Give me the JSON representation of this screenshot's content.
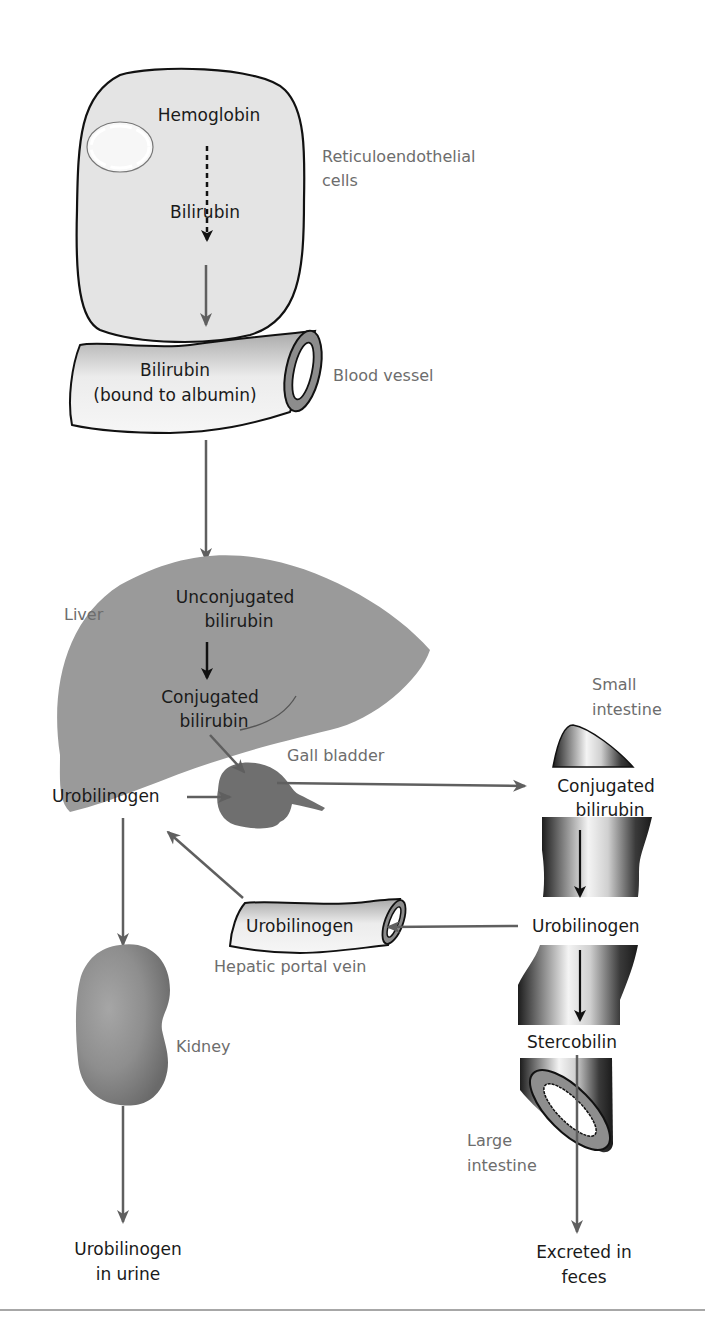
{
  "figure": {
    "colors": {
      "arrow": "#5f5f5f",
      "internal_arrow": "#111111",
      "organ_fill": "#9a9a9a",
      "gall_bladder_fill": "#6f6f6f",
      "cell_fill": "#e4e4e4",
      "label_gray": "#6d6d6d",
      "label_dark": "#1a1a1a"
    },
    "nodes": {
      "hemoglobin": "Hemoglobin",
      "bilirubin_cell": "Bilirubin",
      "bilirubin_bound_line1": "Bilirubin",
      "bilirubin_bound_line2": "(bound to albumin)",
      "unconjugated_line1": "Unconjugated",
      "unconjugated_line2": "bilirubin",
      "conjugated_liver_line1": "Conjugated",
      "conjugated_liver_line2": "bilirubin",
      "urobilinogen_liver": "Urobilinogen",
      "urobilinogen_portal": "Urobilinogen",
      "conjugated_intestine_line1": "Conjugated",
      "conjugated_intestine_line2": "bilirubin",
      "urobilinogen_intestine": "Urobilinogen",
      "stercobilin": "Stercobilin",
      "urine_line1": "Urobilinogen",
      "urine_line2": "in urine",
      "feces_line1": "Excreted in",
      "feces_line2": "feces"
    },
    "structure_labels": {
      "re_cells_line1": "Reticuloendothelial",
      "re_cells_line2": "cells",
      "blood_vessel": "Blood vessel",
      "liver": "Liver",
      "gall_bladder": "Gall bladder",
      "small_intestine_line1": "Small",
      "small_intestine_line2": "intestine",
      "hepatic_portal_vein": "Hepatic portal vein",
      "kidney": "Kidney",
      "large_intestine_line1": "Large",
      "large_intestine_line2": "intestine"
    }
  }
}
